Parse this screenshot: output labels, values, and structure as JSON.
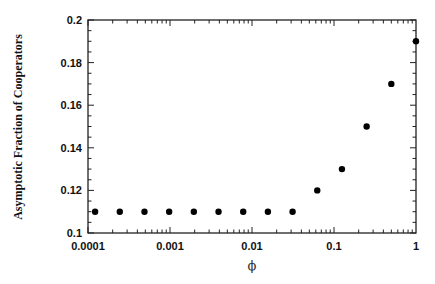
{
  "chart_data": {
    "type": "scatter",
    "title": "",
    "xlabel": "ϕ",
    "ylabel": "Asymptotic Fraction of Cooperators",
    "xscale": "log",
    "xlim": [
      0.0001,
      1
    ],
    "ylim": [
      0.1,
      0.2
    ],
    "grid": false,
    "legend": null,
    "x_ticks": [
      0.0001,
      0.001,
      0.01,
      0.1,
      1
    ],
    "x_tick_labels": [
      "0.0001",
      "0.001",
      "0.01",
      "0.1",
      "1"
    ],
    "y_ticks": [
      0.1,
      0.12,
      0.14,
      0.16,
      0.18,
      0.2
    ],
    "y_tick_labels": [
      "0.1",
      "0.12",
      "0.14",
      "0.16",
      "0.18",
      "0.2"
    ],
    "series": [
      {
        "name": "fraction",
        "marker": "filled-circle",
        "color": "#000000",
        "x": [
          0.00012207,
          0.00024414,
          0.00048828,
          0.00097656,
          0.00195313,
          0.00390625,
          0.0078125,
          0.015625,
          0.03125,
          0.0625,
          0.125,
          0.25,
          0.5,
          1
        ],
        "y": [
          0.11,
          0.11,
          0.11,
          0.11,
          0.11,
          0.11,
          0.11,
          0.11,
          0.11,
          0.12,
          0.13,
          0.15,
          0.17,
          0.19
        ]
      }
    ]
  },
  "layout": {
    "left": 88,
    "right": 416,
    "top": 20,
    "bottom": 233
  }
}
